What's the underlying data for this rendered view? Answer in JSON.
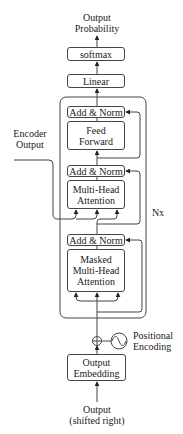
{
  "diagram": {
    "output_label": [
      "Output",
      "Probability"
    ],
    "softmax": "softmax",
    "linear": "Linear",
    "nx_label": "Nx",
    "block": {
      "add_norm_top": "Add & Norm",
      "feed_forward": [
        "Feed",
        "Forward"
      ],
      "add_norm_mid": "Add & Norm",
      "multi_head_attention": [
        "Multi-Head",
        "Attention"
      ],
      "add_norm_bottom": "Add & Norm",
      "masked_multi_head_attention": [
        "Masked",
        "Multi-Head",
        "Attention"
      ]
    },
    "encoder_output": [
      "Encoder",
      "Output"
    ],
    "positional_encoding": [
      "Positional",
      "Encoding"
    ],
    "output_embedding": [
      "Output",
      "Embedding"
    ],
    "input_label": [
      "Output",
      "(shifted right)"
    ],
    "colors": {
      "stroke": "#444444",
      "text": "#222222",
      "background": "#ffffff"
    }
  }
}
